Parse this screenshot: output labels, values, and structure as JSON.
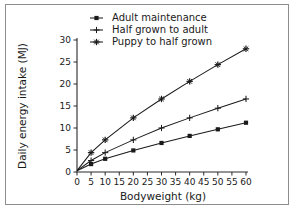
{
  "figure": {
    "border_color": "#8d8d8d",
    "background": "#ffffff",
    "ink_color": "#1a1a1a"
  },
  "chart_data": {
    "type": "line",
    "title": "",
    "xlabel": "Bodyweight (kg)",
    "ylabel": "Daily energy intake (MJ)",
    "xlim": [
      0,
      60
    ],
    "ylim": [
      0,
      30
    ],
    "xticks": [
      0,
      5,
      10,
      15,
      20,
      25,
      30,
      35,
      40,
      45,
      50,
      55,
      60
    ],
    "xticklabels": [
      "0",
      "5",
      "10",
      "15",
      "20",
      "25",
      "30",
      "35",
      "40",
      "45",
      "50",
      "55",
      "60"
    ],
    "yticks": [
      0,
      5,
      10,
      15,
      20,
      25,
      30
    ],
    "yticklabels": [
      "0",
      "5",
      "10",
      "15",
      "20",
      "25",
      "30"
    ],
    "grid": false,
    "legend_position": "top-center",
    "series": [
      {
        "name": "Adult maintenance",
        "marker": "filled-square",
        "x": [
          0,
          5,
          10,
          20,
          30,
          40,
          50,
          60
        ],
        "values": [
          0.3,
          1.8,
          3.0,
          4.9,
          6.6,
          8.2,
          9.7,
          11.2
        ]
      },
      {
        "name": "Half grown to adult",
        "marker": "plus",
        "x": [
          0,
          5,
          10,
          20,
          30,
          40,
          50,
          60
        ],
        "values": [
          0.3,
          2.6,
          4.4,
          7.3,
          10.0,
          12.3,
          14.5,
          16.6
        ]
      },
      {
        "name": "Puppy to half grown",
        "marker": "star-plus",
        "x": [
          0,
          5,
          10,
          20,
          30,
          40,
          50,
          60
        ],
        "values": [
          0.3,
          4.4,
          7.3,
          12.3,
          16.6,
          20.6,
          24.4,
          28.0
        ]
      }
    ]
  },
  "legend": {
    "entries": [
      {
        "label": "Adult maintenance",
        "marker": "filled-square"
      },
      {
        "label": "Half grown to adult",
        "marker": "plus"
      },
      {
        "label": "Puppy to half grown",
        "marker": "star-plus"
      }
    ]
  },
  "axes": {
    "x_title": "Bodyweight (kg)",
    "y_title": "Daily energy intake (MJ)"
  }
}
